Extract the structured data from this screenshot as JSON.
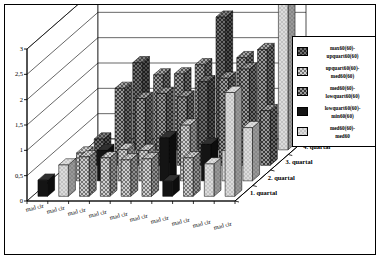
{
  "chart_data": {
    "type": "bar",
    "title": "",
    "subtitle": "",
    "xlabel": "",
    "ylabel": "",
    "zlabel": "",
    "ylim": [
      0,
      3
    ],
    "yticks": [
      "0",
      "0,5",
      "1",
      "1,5",
      "2",
      "2,5",
      "3"
    ],
    "ytick_values": [
      0,
      0.5,
      1,
      1.5,
      2,
      2.5,
      3
    ],
    "grid": true,
    "three_d": true,
    "legend_position": "right",
    "categories": [
      "mad cir",
      "mad cir",
      "mad cir",
      "mad cir",
      "mad cir",
      "mad cir",
      "mad cir",
      "mad cir",
      "mad cir",
      "mad cir"
    ],
    "depth_categories": [
      "1. quartal",
      "2. quartal",
      "3. quartal",
      "4. quartal"
    ],
    "series": [
      {
        "name": "max60(60)-upquart60(60)",
        "color": "#4a4a4a",
        "pattern": "checker-dark"
      },
      {
        "name": "upquart60(60)-med60(60)",
        "color": "#8a8a8a",
        "pattern": "checker-mid"
      },
      {
        "name": "med60(60)-lowquart60(60)",
        "color": "#5f5f5f",
        "pattern": "checker-darkmid"
      },
      {
        "name": "lowquart60(60)-min60(60)",
        "color": "#151515",
        "pattern": "solid-black"
      },
      {
        "name": "med60(60)-med60",
        "color": "#d0d0d0",
        "pattern": "light"
      }
    ],
    "bars": [
      {
        "row": 0,
        "col": 0,
        "series": 3,
        "value": 0.32
      },
      {
        "row": 0,
        "col": 1,
        "series": 4,
        "value": 0.62
      },
      {
        "row": 0,
        "col": 2,
        "series": 1,
        "value": 0.78
      },
      {
        "row": 0,
        "col": 3,
        "series": 1,
        "value": 0.76
      },
      {
        "row": 0,
        "col": 4,
        "series": 1,
        "value": 0.72
      },
      {
        "row": 0,
        "col": 5,
        "series": 1,
        "value": 0.74
      },
      {
        "row": 0,
        "col": 6,
        "series": 3,
        "value": 0.3
      },
      {
        "row": 0,
        "col": 7,
        "series": 1,
        "value": 0.76
      },
      {
        "row": 0,
        "col": 8,
        "series": 4,
        "value": 0.64
      },
      {
        "row": 0,
        "col": 9,
        "series": 4,
        "value": 2.05
      },
      {
        "row": 1,
        "col": 1,
        "series": 1,
        "value": 0.55
      },
      {
        "row": 1,
        "col": 2,
        "series": 3,
        "value": 0.6
      },
      {
        "row": 1,
        "col": 3,
        "series": 1,
        "value": 0.62
      },
      {
        "row": 1,
        "col": 4,
        "series": 1,
        "value": 0.6
      },
      {
        "row": 1,
        "col": 5,
        "series": 3,
        "value": 0.85
      },
      {
        "row": 1,
        "col": 6,
        "series": 1,
        "value": 1.1
      },
      {
        "row": 1,
        "col": 7,
        "series": 3,
        "value": 0.72
      },
      {
        "row": 1,
        "col": 8,
        "series": 4,
        "value": 0.6
      },
      {
        "row": 1,
        "col": 9,
        "series": 4,
        "value": 1.05
      },
      {
        "row": 2,
        "col": 1,
        "series": 0,
        "value": 0.52
      },
      {
        "row": 2,
        "col": 2,
        "series": 2,
        "value": 1.52
      },
      {
        "row": 2,
        "col": 3,
        "series": 2,
        "value": 1.32
      },
      {
        "row": 2,
        "col": 4,
        "series": 2,
        "value": 1.42
      },
      {
        "row": 2,
        "col": 5,
        "series": 2,
        "value": 1.35
      },
      {
        "row": 2,
        "col": 6,
        "series": 0,
        "value": 1.65
      },
      {
        "row": 2,
        "col": 7,
        "series": 2,
        "value": 1.72
      },
      {
        "row": 2,
        "col": 8,
        "series": 2,
        "value": 1.9
      },
      {
        "row": 2,
        "col": 9,
        "series": 2,
        "value": 1.08
      },
      {
        "row": 3,
        "col": 2,
        "series": 0,
        "value": 1.72
      },
      {
        "row": 3,
        "col": 3,
        "series": 2,
        "value": 1.48
      },
      {
        "row": 3,
        "col": 4,
        "series": 2,
        "value": 1.5
      },
      {
        "row": 3,
        "col": 5,
        "series": 2,
        "value": 1.68
      },
      {
        "row": 3,
        "col": 6,
        "series": 0,
        "value": 2.62
      },
      {
        "row": 3,
        "col": 7,
        "series": 2,
        "value": 1.82
      },
      {
        "row": 3,
        "col": 8,
        "series": 2,
        "value": 1.98
      },
      {
        "row": 3,
        "col": 9,
        "series": 4,
        "value": 3.0
      }
    ]
  },
  "legend": {
    "entries": [
      "max60(60)-upquart60(60)",
      "upquart60(60)-med60(60)",
      "med60(60)-lowquart60(60)",
      "lowquart60(60)-min60(60)",
      "med60(60)-med60"
    ],
    "lines": [
      [
        "max60(60)-",
        "upquart60(60)"
      ],
      [
        "upquart60(60)-",
        "med60(60)"
      ],
      [
        "med60(60)-",
        "lowquart60(60)"
      ],
      [
        "lowquart60(60)-",
        "min60(60)"
      ],
      [
        "med60(60)-",
        "med60"
      ]
    ]
  }
}
